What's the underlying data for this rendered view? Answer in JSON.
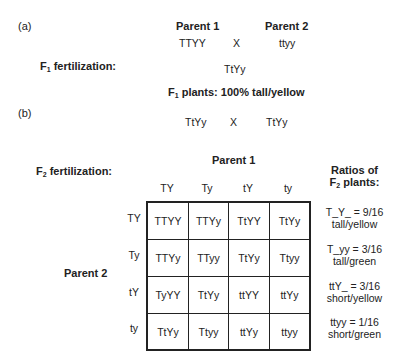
{
  "part_a": {
    "label": "(a)",
    "parent1_title": "Parent 1",
    "parent2_title": "Parent 2",
    "parent1_genotype": "TTYY",
    "cross_symbol": "X",
    "parent2_genotype": "ttyy",
    "f1_fertilization_label_pre": "F",
    "f1_fertilization_sub": "1",
    "f1_fertilization_label_post": " fertilization:",
    "f1_genotype": "TtYy",
    "f1_plants_pre": "F",
    "f1_plants_sub": "1",
    "f1_plants_post": " plants:  100% tall/yellow"
  },
  "part_b": {
    "label": "(b)",
    "cross_left": "TtYy",
    "cross_symbol": "X",
    "cross_right": "TtYy",
    "f2_fertilization_pre": "F",
    "f2_fertilization_sub": "2",
    "f2_fertilization_post": " fertilization:",
    "parent1_title": "Parent 1",
    "parent2_title": "Parent 2",
    "col_headers": [
      "TY",
      "Ty",
      "tY",
      "ty"
    ],
    "row_headers": [
      "TY",
      "Ty",
      "tY",
      "ty"
    ],
    "cells": [
      [
        "TTYY",
        "TTYy",
        "TtYY",
        "TtYy"
      ],
      [
        "TTYy",
        "TTyy",
        "TtYy",
        "Ttyy"
      ],
      [
        "TyYY",
        "TtYy",
        "ttYY",
        "ttYy"
      ],
      [
        "TtYy",
        "Ttyy",
        "ttYy",
        "ttyy"
      ]
    ],
    "ratios_title_line1": "Ratios of",
    "ratios_title_pre": "F",
    "ratios_title_sub": "2",
    "ratios_title_post": " plants:",
    "ratios": [
      {
        "formula": "T_Y_ = 9/16",
        "phenotype": "tall/yellow"
      },
      {
        "formula": "T_yy = 3/16",
        "phenotype": "tall/green"
      },
      {
        "formula": "ttY_ = 3/16",
        "phenotype": "short/yellow"
      },
      {
        "formula": "ttyy = 1/16",
        "phenotype": "short/green"
      }
    ]
  }
}
